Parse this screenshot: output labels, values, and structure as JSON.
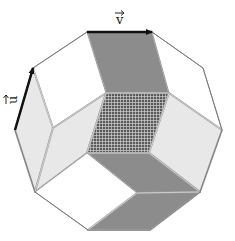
{
  "diagram": {
    "type": "rhombic tiling of a decagon (zonogon)",
    "labels": {
      "u": "u",
      "v": "v"
    },
    "colors": {
      "outline": "#7a7a7a",
      "white": "#ffffff",
      "light": "#e8e8e8",
      "grey": "#8c8c8c",
      "hatch_bg": "#5a5a5a",
      "hatch_line": "#d0d0d0",
      "vector": "#111111"
    },
    "outline": [
      [
        87,
        32
      ],
      [
        152,
        32
      ],
      [
        203,
        68
      ],
      [
        222,
        130
      ],
      [
        200,
        192
      ],
      [
        150,
        230
      ],
      [
        88,
        230
      ],
      [
        35,
        192
      ],
      [
        15,
        130
      ],
      [
        33,
        68
      ]
    ],
    "tiles": [
      {
        "name": "top-grey",
        "fill": "grey",
        "points": [
          [
            87,
            32
          ],
          [
            152,
            32
          ],
          [
            169,
            93
          ],
          [
            106,
            93
          ]
        ]
      },
      {
        "name": "top-left-white",
        "fill": "white",
        "points": [
          [
            33,
            68
          ],
          [
            87,
            32
          ],
          [
            106,
            93
          ],
          [
            53,
            128
          ]
        ]
      },
      {
        "name": "top-right-white",
        "fill": "white",
        "points": [
          [
            152,
            32
          ],
          [
            203,
            68
          ],
          [
            222,
            130
          ],
          [
            169,
            93
          ]
        ]
      },
      {
        "name": "left-light",
        "fill": "light",
        "points": [
          [
            15,
            130
          ],
          [
            33,
            68
          ],
          [
            53,
            128
          ],
          [
            35,
            192
          ]
        ]
      },
      {
        "name": "inner-left-light",
        "fill": "light",
        "points": [
          [
            53,
            128
          ],
          [
            106,
            93
          ],
          [
            87,
            153
          ],
          [
            35,
            192
          ]
        ]
      },
      {
        "name": "center-hatched",
        "fill": "hatch",
        "points": [
          [
            106,
            93
          ],
          [
            169,
            93
          ],
          [
            149,
            153
          ],
          [
            87,
            153
          ]
        ]
      },
      {
        "name": "right-light",
        "fill": "light",
        "points": [
          [
            169,
            93
          ],
          [
            222,
            130
          ],
          [
            200,
            192
          ],
          [
            149,
            153
          ]
        ]
      },
      {
        "name": "lower-grey",
        "fill": "grey",
        "points": [
          [
            87,
            153
          ],
          [
            149,
            153
          ],
          [
            200,
            192
          ],
          [
            137,
            193
          ]
        ]
      },
      {
        "name": "bottom-left-white",
        "fill": "white",
        "points": [
          [
            35,
            192
          ],
          [
            87,
            153
          ],
          [
            137,
            193
          ],
          [
            88,
            230
          ]
        ]
      },
      {
        "name": "bottom-grey",
        "fill": "grey",
        "points": [
          [
            137,
            193
          ],
          [
            200,
            192
          ],
          [
            150,
            230
          ],
          [
            88,
            230
          ]
        ]
      }
    ],
    "vectors": {
      "v": {
        "from": [
          87,
          32
        ],
        "to": [
          152,
          32
        ]
      },
      "u": {
        "from": [
          15,
          130
        ],
        "to": [
          33,
          68
        ]
      }
    }
  }
}
